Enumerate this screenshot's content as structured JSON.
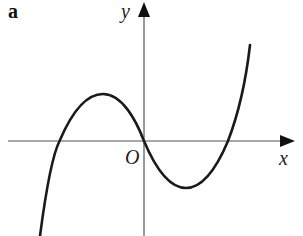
{
  "figure": {
    "panel_label": "a",
    "axes": {
      "x_label": "x",
      "y_label": "y",
      "origin_label": "O"
    },
    "curve": {
      "description": "cubic function with local maximum left of y-axis, passing through origin, local minimum right of y-axis",
      "color": "#1a1a1a"
    },
    "axis_color": "#555555"
  }
}
